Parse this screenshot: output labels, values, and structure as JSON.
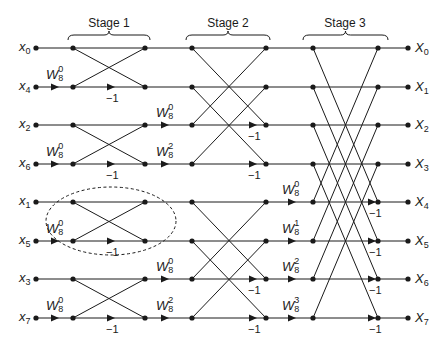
{
  "figure": {
    "type": "8-point radix-2 decimation-in-time FFT butterfly (signal flow graph)",
    "stages": [
      {
        "label": "Stage 1",
        "cx": 109,
        "brace_x0": 68,
        "brace_x1": 150
      },
      {
        "label": "Stage 2",
        "cx": 228,
        "brace_x0": 186,
        "brace_x1": 270
      },
      {
        "label": "Stage 3",
        "cx": 345,
        "brace_x0": 303,
        "brace_x1": 388
      }
    ],
    "rows_y": [
      48,
      87,
      125,
      164,
      202,
      241,
      279,
      318
    ],
    "columns_x": [
      36,
      73,
      145,
      192,
      266,
      313,
      378,
      408
    ],
    "inputs": [
      {
        "sym": "x",
        "sub": "0"
      },
      {
        "sym": "x",
        "sub": "4"
      },
      {
        "sym": "x",
        "sub": "2"
      },
      {
        "sym": "x",
        "sub": "6"
      },
      {
        "sym": "x",
        "sub": "1"
      },
      {
        "sym": "x",
        "sub": "5"
      },
      {
        "sym": "x",
        "sub": "3"
      },
      {
        "sym": "x",
        "sub": "7"
      }
    ],
    "outputs": [
      {
        "sym": "X",
        "sub": "0"
      },
      {
        "sym": "X",
        "sub": "1"
      },
      {
        "sym": "X",
        "sub": "2"
      },
      {
        "sym": "X",
        "sub": "3"
      },
      {
        "sym": "X",
        "sub": "4"
      },
      {
        "sym": "X",
        "sub": "5"
      },
      {
        "sym": "X",
        "sub": "6"
      },
      {
        "sym": "X",
        "sub": "7"
      }
    ],
    "twiddles": [
      {
        "stage": 1,
        "row": 1,
        "base": "W",
        "sub": "8",
        "sup": "0"
      },
      {
        "stage": 1,
        "row": 3,
        "base": "W",
        "sub": "8",
        "sup": "0"
      },
      {
        "stage": 1,
        "row": 5,
        "base": "W",
        "sub": "8",
        "sup": "0"
      },
      {
        "stage": 1,
        "row": 7,
        "base": "W",
        "sub": "8",
        "sup": "0"
      },
      {
        "stage": 2,
        "row": 2,
        "base": "W",
        "sub": "8",
        "sup": "0"
      },
      {
        "stage": 2,
        "row": 3,
        "base": "W",
        "sub": "8",
        "sup": "2"
      },
      {
        "stage": 2,
        "row": 6,
        "base": "W",
        "sub": "8",
        "sup": "0"
      },
      {
        "stage": 2,
        "row": 7,
        "base": "W",
        "sub": "8",
        "sup": "2"
      },
      {
        "stage": 3,
        "row": 4,
        "base": "W",
        "sub": "8",
        "sup": "0"
      },
      {
        "stage": 3,
        "row": 5,
        "base": "W",
        "sub": "8",
        "sup": "1"
      },
      {
        "stage": 3,
        "row": 6,
        "base": "W",
        "sub": "8",
        "sup": "2"
      },
      {
        "stage": 3,
        "row": 7,
        "base": "W",
        "sub": "8",
        "sup": "3"
      }
    ],
    "negation_label": "−1",
    "highlight": {
      "description": "dashed ellipse around a single butterfly (stage 1, rows x1/x5)",
      "cx": 111,
      "cy": 221,
      "rx": 65,
      "ry": 34
    },
    "colors": {
      "line": "#1a1a1a",
      "background": "#ffffff"
    }
  }
}
